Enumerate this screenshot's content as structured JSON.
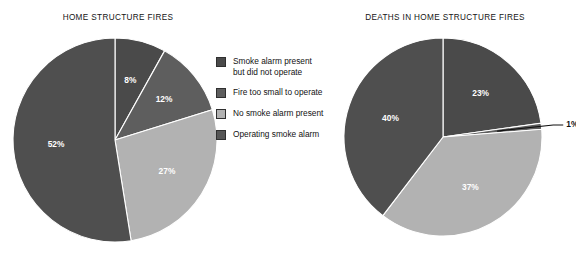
{
  "chart_data": [
    {
      "type": "pie",
      "title": "HOME STRUCTURE FIRES",
      "categories": [
        "Smoke alarm present but did not operate",
        "Fire too small to operate",
        "No smoke alarm present",
        "Operating smoke alarm"
      ],
      "values": [
        8,
        12,
        27,
        52
      ],
      "labels": [
        "8%",
        "12%",
        "27%",
        "52%"
      ],
      "colors": [
        "#4a4a4a",
        "#5e5e5e",
        "#b2b2b2",
        "#4f4f4f"
      ],
      "start_angle_deg": 0,
      "direction": "clockwise",
      "legend_position": "center",
      "grid": false,
      "xlabel": "",
      "ylabel": ""
    },
    {
      "type": "pie",
      "title": "DEATHS IN HOME STRUCTURE FIRES",
      "categories": [
        "Smoke alarm present but did not operate",
        "Fire too small to operate",
        "No smoke alarm present",
        "Operating smoke alarm"
      ],
      "values": [
        23,
        1,
        37,
        40
      ],
      "labels": [
        "23%",
        "1%",
        "37%",
        "40%"
      ],
      "colors": [
        "#4a4a4a",
        "#5e5e5e",
        "#b2b2b2",
        "#4f4f4f"
      ],
      "start_angle_deg": 0,
      "direction": "clockwise",
      "legend_position": "center",
      "grid": false,
      "xlabel": "",
      "ylabel": ""
    }
  ],
  "titles": {
    "left": "HOME STRUCTURE FIRES",
    "right": "DEATHS IN HOME STRUCTURE FIRES"
  },
  "legend": {
    "items": [
      {
        "label": "Smoke alarm present\nbut did not operate",
        "color": "#4a4a4a"
      },
      {
        "label": "Fire too small to operate",
        "color": "#5e5e5e"
      },
      {
        "label": "No smoke alarm present",
        "color": "#b2b2b2"
      },
      {
        "label": "Operating smoke alarm",
        "color": "#555555"
      }
    ]
  },
  "left_pie": {
    "slices": [
      {
        "label": "8%",
        "value": 8,
        "color": "#4a4a4a"
      },
      {
        "label": "12%",
        "value": 12,
        "color": "#5e5e5e"
      },
      {
        "label": "27%",
        "value": 27,
        "color": "#b2b2b2"
      },
      {
        "label": "52%",
        "value": 52,
        "color": "#4f4f4f"
      }
    ]
  },
  "right_pie": {
    "slices": [
      {
        "label": "23%",
        "value": 23,
        "color": "#4a4a4a"
      },
      {
        "label": "1%",
        "value": 1,
        "color": "#5e5e5e"
      },
      {
        "label": "37%",
        "value": 37,
        "color": "#b2b2b2"
      },
      {
        "label": "40%",
        "value": 40,
        "color": "#4f4f4f"
      }
    ]
  }
}
